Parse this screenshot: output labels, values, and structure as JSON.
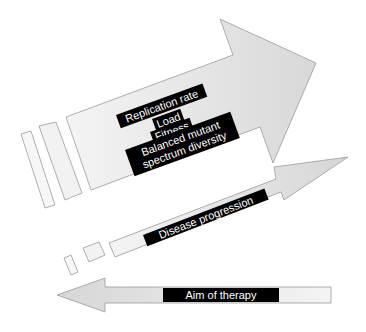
{
  "diagram": {
    "top_arrow": {
      "direction": "up-right",
      "labels": {
        "replication_rate": "Replication rate",
        "load": "Load",
        "fitness": "Fitness",
        "balanced_line1": "Balanced mutant",
        "balanced_line2": "spectrum diversity"
      }
    },
    "middle_arrow": {
      "direction": "up-right",
      "label": "Disease progression"
    },
    "bottom_arrow": {
      "direction": "left",
      "label": "Aim of therapy"
    },
    "colors": {
      "arrow_fill": "#dcdcdc",
      "arrow_fill_light": "#eeeeee",
      "arrow_stroke": "#9a9a9a",
      "label_bg": "#000000",
      "label_text": "#ffffff"
    }
  }
}
